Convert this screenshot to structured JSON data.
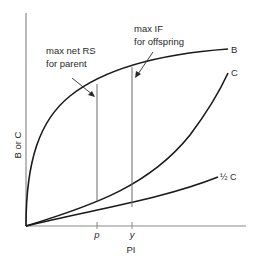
{
  "diagram": {
    "axes": {
      "x_label": "PI",
      "y_label": "B or C",
      "x_ticks": [
        {
          "label": "p",
          "x": 97
        },
        {
          "label": "y",
          "x": 132
        }
      ]
    },
    "curves": [
      {
        "id": "B",
        "label": "B",
        "shape": "concave, rising steeply then flattening"
      },
      {
        "id": "C",
        "label": "C",
        "shape": "convex, accelerating"
      },
      {
        "id": "half_C",
        "label": "½ C",
        "shape": "gently convex, half of C"
      }
    ],
    "annotations": [
      {
        "id": "parent",
        "line1": "max net RS",
        "line2": "for parent",
        "points_to": "p"
      },
      {
        "id": "offspring",
        "line1": "max IF",
        "line2": "for offspring",
        "points_to": "y"
      }
    ],
    "colors": {
      "curve": "#1a1a1a",
      "axis": "#8a8a8a",
      "text": "#2a2a2a"
    }
  }
}
